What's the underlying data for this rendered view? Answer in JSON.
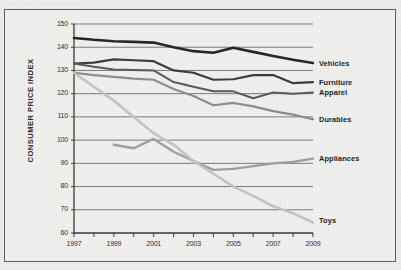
{
  "top_strip": {
    "text": "· ·················· ··············"
  },
  "chart_data": {
    "type": "line",
    "title": "",
    "xlabel": "",
    "ylabel": "CONSUMER PRICE INDEX",
    "xlim": [
      1997,
      2009
    ],
    "ylim": [
      60,
      150
    ],
    "yticks": [
      60,
      70,
      80,
      90,
      100,
      110,
      120,
      130,
      140,
      150
    ],
    "xticks": [
      1997,
      1999,
      2001,
      2003,
      2005,
      2007,
      2009
    ],
    "xticks_minor": [
      1998,
      2000,
      2002,
      2004,
      2006,
      2008
    ],
    "grid": "horizontal",
    "legend": "right-inline-labels",
    "x": [
      1997,
      1998,
      1999,
      2000,
      2001,
      2002,
      2003,
      2004,
      2005,
      2006,
      2007,
      2008,
      2009
    ],
    "series": [
      {
        "name": "Vehicles",
        "color": "#262626",
        "width": 2.6,
        "label_y": 133.0,
        "values": [
          144.0,
          143.2,
          142.6,
          142.3,
          142.0,
          140.0,
          138.3,
          137.6,
          139.8,
          138.0,
          136.2,
          134.6,
          133.2
        ]
      },
      {
        "name": "Furniture",
        "color": "#3c3c3c",
        "width": 2.2,
        "label_y": 125.0,
        "values": [
          133.0,
          133.4,
          134.8,
          134.4,
          134.0,
          130.0,
          129.0,
          126.0,
          126.2,
          128.0,
          128.0,
          124.5,
          125.0
        ]
      },
      {
        "name": "Apparel",
        "color": "#5a5a5a",
        "width": 2.0,
        "label_y": 120.5,
        "values": [
          133.0,
          131.6,
          130.4,
          130.2,
          130.0,
          125.0,
          123.0,
          121.0,
          121.0,
          118.0,
          120.5,
          120.0,
          120.5
        ]
      },
      {
        "name": "Durables",
        "color": "#8c8c8c",
        "width": 2.2,
        "label_y": 109.0,
        "values": [
          129.0,
          128.0,
          127.2,
          126.5,
          126.0,
          122.0,
          119.0,
          115.0,
          116.0,
          114.5,
          112.5,
          111.0,
          109.0
        ]
      },
      {
        "name": "Appliances",
        "color": "#9e9e9e",
        "width": 2.4,
        "label_y": 92.0,
        "start_index": 2,
        "values": [
          null,
          null,
          98.0,
          96.5,
          100.5,
          95.0,
          91.0,
          87.2,
          87.6,
          88.8,
          90.0,
          90.6,
          92.0
        ]
      },
      {
        "name": "Toys",
        "color": "#c2c2c2",
        "width": 2.6,
        "label_y": 65.5,
        "values": [
          129.0,
          123.0,
          117.0,
          110.0,
          103.0,
          98.0,
          91.0,
          85.5,
          80.0,
          76.0,
          71.5,
          68.5,
          64.5
        ]
      }
    ]
  },
  "axis_colors": {
    "axis_line": "#4a4a4a",
    "gridline": "#6d6d6d",
    "tick_text": "#2e2e2e",
    "frame": "#5d5d5d",
    "background": "#ececeb"
  }
}
